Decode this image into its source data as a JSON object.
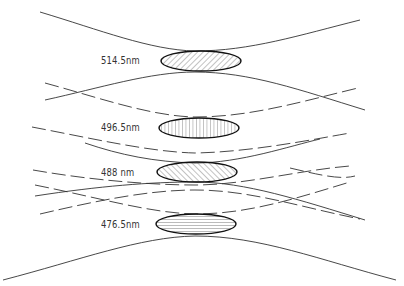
{
  "diagram": {
    "type": "laser-beam-waist-focusing",
    "beams": [
      {
        "wavelength_label": "514.5nm",
        "hatch": "diagonal-forward"
      },
      {
        "wavelength_label": "496.5nm",
        "hatch": "vertical"
      },
      {
        "wavelength_label": "488 nm",
        "hatch": "diagonal-backward"
      },
      {
        "wavelength_label": "476.5nm",
        "hatch": "horizontal"
      }
    ],
    "colors": {
      "line": "#222222",
      "hatch": "#555555",
      "background": "#ffffff"
    }
  }
}
